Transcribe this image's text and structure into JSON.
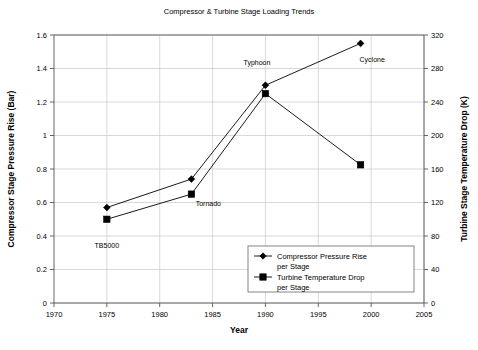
{
  "chart_data": {
    "type": "line",
    "title": "Compressor & Turbine Stage Loading Trends",
    "xlabel": "Year",
    "ylabel": "Compressor Stage Pressure Rise (Bar)",
    "y2label": "Turbine Stage Temperature Drop (K)",
    "xlim": [
      1970,
      2005
    ],
    "ylim": [
      0,
      1.6
    ],
    "y2lim": [
      0,
      320
    ],
    "xticks": [
      1970,
      1975,
      1980,
      1985,
      1990,
      1995,
      2000,
      2005
    ],
    "xtick_labels": [
      "1970",
      "1975",
      "1980",
      "1985",
      "1990",
      "1995",
      "2000",
      "2005"
    ],
    "yticks": [
      0,
      0.2,
      0.4,
      0.6,
      0.8,
      1,
      1.2,
      1.4,
      1.6
    ],
    "ytick_labels": [
      "0",
      "0.2",
      "0.4",
      "0.6",
      "0.8",
      "1",
      "1.2",
      "1.4",
      "1.6"
    ],
    "y2ticks": [
      0,
      40,
      80,
      120,
      160,
      200,
      240,
      280,
      320
    ],
    "y2tick_labels": [
      "0",
      "40",
      "80",
      "120",
      "160",
      "200",
      "240",
      "280",
      "320"
    ],
    "grid": true,
    "legend_position": "lower-right",
    "x": [
      1975,
      1983,
      1990,
      1999
    ],
    "series": [
      {
        "name": "Compressor Pressure Rise per Stage",
        "marker": "diamond",
        "axis": "left",
        "values": [
          0.57,
          0.74,
          1.3,
          1.55
        ]
      },
      {
        "name": "Turbine Temperature Drop per Stage",
        "marker": "square",
        "axis": "right",
        "values": [
          100,
          130,
          250,
          165
        ],
        "values_left_scale": [
          0.5,
          0.65,
          1.25,
          0.825
        ]
      }
    ],
    "annotations": [
      {
        "text": "TB5000",
        "x": 1975,
        "y": 0.33
      },
      {
        "text": "Tornado",
        "x": 1984.6,
        "y": 0.58
      },
      {
        "text": "Typhoon",
        "x": 1989.2,
        "y": 1.42
      },
      {
        "text": "Cyclone",
        "x": 2000.1,
        "y": 1.44
      }
    ],
    "legend": [
      {
        "label_line1": "Compressor Pressure Rise",
        "label_line2": "per Stage",
        "marker": "diamond"
      },
      {
        "label_line1": "Turbine Temperature Drop",
        "label_line2": "per Stage",
        "marker": "square"
      }
    ],
    "colors": {
      "series": "#000000",
      "grid": "#c8c8c8",
      "frame": "#555555",
      "background": "#ffffff"
    }
  }
}
